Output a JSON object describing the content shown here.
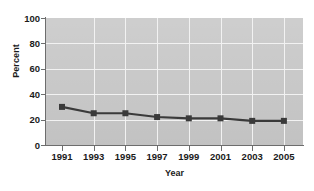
{
  "chart_data": {
    "type": "line",
    "title": "",
    "xlabel": "Year",
    "ylabel": "Percent",
    "categories": [
      "1991",
      "1993",
      "1995",
      "1997",
      "1999",
      "2001",
      "2003",
      "2005"
    ],
    "x": [
      1991,
      1993,
      1995,
      1997,
      1999,
      2001,
      2003,
      2005
    ],
    "values": [
      30,
      25,
      25,
      22,
      21,
      21,
      19,
      19
    ],
    "series": [
      {
        "name": "Percent",
        "values": [
          30,
          25,
          25,
          22,
          21,
          21,
          19,
          19
        ]
      }
    ],
    "ylim": [
      0,
      100
    ],
    "yticks": [
      0,
      20,
      40,
      60,
      80,
      100
    ],
    "ytick_labels": [
      "0",
      "20",
      "40",
      "60",
      "80",
      "100"
    ],
    "grid": true,
    "grid_color": "#f2f2f2",
    "legend": "none",
    "plot_background": "#c9c9c9",
    "line_color": "#3a3a3a",
    "marker": "square",
    "marker_color": "#3a3a3a",
    "figure_background": "#ffffff",
    "axis_color": "#6d6d6d",
    "text_color": "#1b1b1b"
  }
}
